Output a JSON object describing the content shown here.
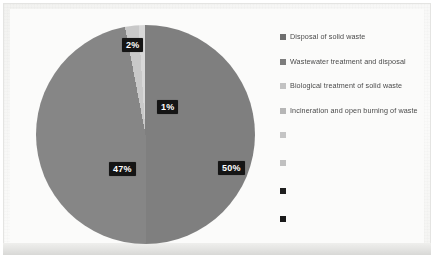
{
  "chart_data": {
    "type": "pie",
    "title": "",
    "subtitle": "",
    "xlabel": "",
    "ylabel": "",
    "grid": false,
    "legend_position": "right",
    "categories": [
      "Disposal of solid waste",
      "Wastewater treatment and disposal",
      "Biological treatment of solid waste",
      "Incineration and open burning of waste"
    ],
    "values": [
      50,
      47,
      2,
      1
    ],
    "data_labels": [
      "50%",
      "47%",
      "2%",
      "1%"
    ],
    "colors": [
      "#7f7f7f",
      "#868686",
      "#c9c9c9",
      "#d8d8d8"
    ],
    "slices": [
      {
        "label": "50%",
        "value": 50,
        "color": "#7f7f7f",
        "category": "Disposal of solid waste"
      },
      {
        "label": "47%",
        "value": 47,
        "color": "#868686",
        "category": "Wastewater treatment and disposal"
      },
      {
        "label": "2%",
        "value": 2,
        "color": "#c9c9c9",
        "category": "Biological treatment of solid waste"
      },
      {
        "label": "1%",
        "value": 1,
        "color": "#d8d8d8",
        "category": "Incineration and open burning of waste"
      }
    ]
  },
  "legend": {
    "items": [
      {
        "label": "Disposal of solid waste",
        "color": "#6e6e6e"
      },
      {
        "label": "Wastewater treatment and disposal",
        "color": "#7c7c7c"
      },
      {
        "label": "Biological treatment of solid waste",
        "color": "#c2c2c2"
      },
      {
        "label": "Incineration and open burning of waste",
        "color": "#b6b6b6"
      },
      {
        "label": "",
        "color": "#c4c4c4"
      },
      {
        "label": "",
        "color": "#c0c0c0"
      },
      {
        "label": "",
        "color": "#1f1f1f"
      },
      {
        "label": "",
        "color": "#1a1a1a"
      }
    ]
  },
  "labels": {
    "slice_2": "2%",
    "slice_1": "1%",
    "slice_47": "47%",
    "slice_50": "50%"
  },
  "colors": {
    "slice_major": "#7f7f7f",
    "slice_second": "#868686",
    "slice_small": "#c9c9c9",
    "slice_tiny": "#d8d8d8",
    "label_bg": "#151515",
    "label_fg": "#ffffff",
    "page_bg": "#fbfbfa"
  }
}
